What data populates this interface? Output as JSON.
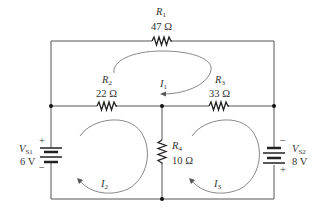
{
  "circuit": {
    "resistors": [
      {
        "id": "R1",
        "name": "R",
        "sub": "1",
        "value": "47 Ω"
      },
      {
        "id": "R2",
        "name": "R",
        "sub": "2",
        "value": "22 Ω"
      },
      {
        "id": "R3",
        "name": "R",
        "sub": "3",
        "value": "33 Ω"
      },
      {
        "id": "R4",
        "name": "R",
        "sub": "4",
        "value": "10 Ω"
      }
    ],
    "sources": [
      {
        "id": "VS1",
        "name": "V",
        "sub": "S1",
        "value": "6 V",
        "top_polarity": "+",
        "bottom_polarity": "−"
      },
      {
        "id": "VS2",
        "name": "V",
        "sub": "S2",
        "value": "8 V",
        "top_polarity": "−",
        "bottom_polarity": "+"
      }
    ],
    "loop_currents": [
      {
        "id": "I1",
        "name": "I",
        "sub": "1"
      },
      {
        "id": "I2",
        "name": "I",
        "sub": "2"
      },
      {
        "id": "I3",
        "name": "I",
        "sub": "3"
      }
    ]
  }
}
